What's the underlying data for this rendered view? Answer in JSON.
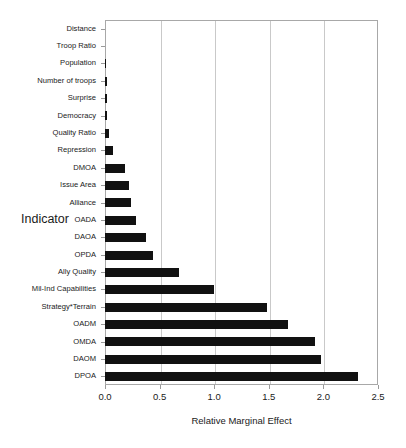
{
  "chart_data": {
    "type": "bar",
    "orientation": "horizontal",
    "title": "",
    "xlabel": "Relative Marginal Effect",
    "ylabel": "Indicator",
    "xlim": [
      0.0,
      2.5
    ],
    "xticks": [
      0.0,
      0.5,
      1.0,
      1.5,
      2.0,
      2.5
    ],
    "xtick_labels": [
      "0.0",
      "0.5",
      "1.0",
      "1.5",
      "2.0",
      "2.5"
    ],
    "grid": true,
    "grid_axis": "x",
    "legend": null,
    "bar_color": "#111111",
    "categories": [
      "Distance",
      "Troop Ratio",
      "Population",
      "Number of troops",
      "Surprise",
      "Democracy",
      "Quality Ratio",
      "Repression",
      "DMOA",
      "Issue Area",
      "Alliance",
      "OADA",
      "DAOA",
      "OPDA",
      "Ally Quality",
      "Mil-Ind Capabilities",
      "Strategy*Terrain",
      "OADM",
      "OMDA",
      "DAOM",
      "DPOA"
    ],
    "values": [
      0.0,
      0.0,
      0.005,
      0.02,
      0.02,
      0.02,
      0.035,
      0.07,
      0.18,
      0.22,
      0.24,
      0.28,
      0.38,
      0.44,
      0.68,
      1.0,
      1.48,
      1.68,
      1.92,
      1.98,
      2.32
    ]
  }
}
